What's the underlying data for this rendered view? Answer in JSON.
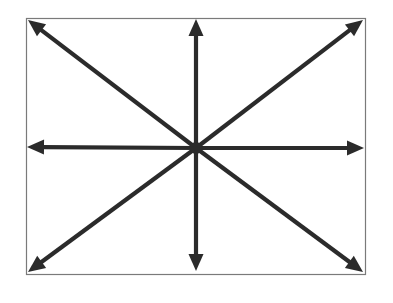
{
  "figure": {
    "canvas": {
      "width": 393,
      "height": 303,
      "background": "#ffffff"
    },
    "frame": {
      "name": "rectangular-border",
      "x": 26,
      "y": 18,
      "width": 339,
      "height": 256,
      "stroke_color": "#7a7a7a",
      "stroke_width": 1.2,
      "fill": "#ffffff"
    },
    "center": {
      "label": "center-point",
      "x": 196,
      "y": 148,
      "hub_radius": 6,
      "color": "#2b2b2b"
    },
    "style": {
      "arrow_color": "#2b2b2b",
      "shaft_width": 4.2,
      "head_length": 17,
      "head_half_width": 7.5
    },
    "arrow_count": 8,
    "arrows": [
      {
        "name": "arrow-north",
        "direction": "up",
        "label": "N",
        "angle_deg": 90,
        "tip_x": 196,
        "tip_y": 19
      },
      {
        "name": "arrow-northeast",
        "direction": "up-right",
        "label": "NE",
        "angle_deg": 45,
        "tip_x": 363,
        "tip_y": 20
      },
      {
        "name": "arrow-east",
        "direction": "right",
        "label": "E",
        "angle_deg": 0,
        "tip_x": 364,
        "tip_y": 148
      },
      {
        "name": "arrow-southeast",
        "direction": "down-right",
        "label": "SE",
        "angle_deg": -45,
        "tip_x": 363,
        "tip_y": 272
      },
      {
        "name": "arrow-south",
        "direction": "down",
        "label": "S",
        "angle_deg": -90,
        "tip_x": 196,
        "tip_y": 271
      },
      {
        "name": "arrow-southwest",
        "direction": "down-left",
        "label": "SW",
        "angle_deg": -135,
        "tip_x": 28,
        "tip_y": 272
      },
      {
        "name": "arrow-west",
        "direction": "left",
        "label": "W",
        "angle_deg": 180,
        "tip_x": 27,
        "tip_y": 147
      },
      {
        "name": "arrow-northwest",
        "direction": "up-left",
        "label": "NW",
        "angle_deg": 135,
        "tip_x": 28,
        "tip_y": 20
      }
    ]
  }
}
